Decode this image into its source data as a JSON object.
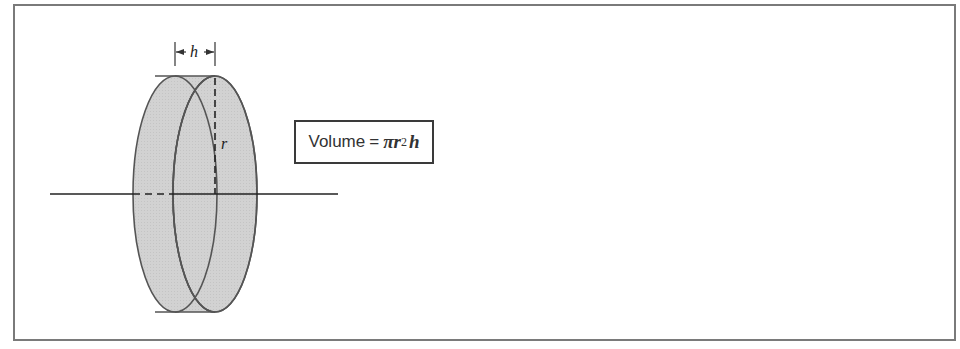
{
  "diagram": {
    "labels": {
      "height": "h",
      "radius": "r"
    },
    "formula": {
      "word": "Volume",
      "equals": "=",
      "pi": "π",
      "r": "r",
      "exponent": "2",
      "h": "h"
    },
    "colors": {
      "fill": "#cfcfcf",
      "stroke": "#555555",
      "frame": "#7a7a7a"
    }
  }
}
